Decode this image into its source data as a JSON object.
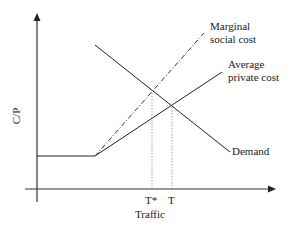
{
  "diagram": {
    "title": "",
    "y_axis_label": "C/P",
    "x_axis_label": "Traffic",
    "x_ticks": [
      "T*",
      "T"
    ],
    "curves": [
      {
        "name": "Marginal social cost",
        "line1": "Marginal",
        "line2": "social cost",
        "style": "dash-dot"
      },
      {
        "name": "Average private cost",
        "line1": "Average",
        "line2": "private cost",
        "style": "solid"
      },
      {
        "name": "Demand",
        "label": "Demand",
        "style": "solid"
      }
    ],
    "reference_lines": [
      {
        "name": "T*",
        "style": "dotted",
        "description": "optimal traffic at MSC = Demand"
      },
      {
        "name": "T",
        "style": "dotted",
        "description": "equilibrium traffic at APC = Demand"
      }
    ],
    "colors": {
      "line": "#222222",
      "dotted": "#888888"
    }
  }
}
